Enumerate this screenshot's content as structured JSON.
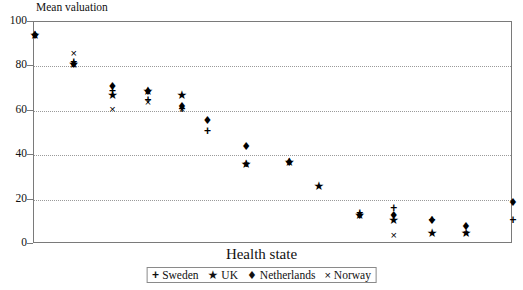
{
  "chart_data": {
    "type": "scatter",
    "title": "",
    "ylabel": "Mean valuation",
    "xlabel": "Health state",
    "ylim": [
      0,
      100
    ],
    "yticks": [
      0,
      20,
      40,
      60,
      80,
      100
    ],
    "grid": true,
    "legend_position": "bottom-center",
    "categories": [
      "1",
      "2",
      "3",
      "4",
      "5",
      "6",
      "7",
      "8",
      "9",
      "10",
      "11",
      "12",
      "13",
      "14"
    ],
    "series": [
      {
        "name": "Sweden",
        "symbol": "+",
        "values": [
          94,
          82,
          69,
          65,
          61,
          51,
          36,
          37,
          null,
          14,
          16,
          11,
          null,
          11
        ]
      },
      {
        "name": "UK",
        "symbol": "★",
        "values": [
          94,
          81,
          67,
          69,
          67,
          null,
          36,
          37,
          26,
          13,
          11,
          5,
          5,
          null
        ]
      },
      {
        "name": "Netherlands",
        "symbol": "♦",
        "values": [
          94,
          81,
          71,
          69,
          62,
          56,
          44,
          37,
          null,
          13,
          13,
          11,
          8,
          19
        ]
      },
      {
        "name": "Norway",
        "symbol": "×",
        "values": [
          94,
          86,
          61,
          64,
          61,
          null,
          36,
          null,
          null,
          null,
          4,
          null,
          5,
          null
        ]
      }
    ],
    "x_positions": [
      0.2,
      8.3,
      16.4,
      23.8,
      30.9,
      36.2,
      44.3,
      53.3,
      59.5,
      68.0,
      75.1,
      83.1,
      90.2,
      100.0
    ]
  },
  "legend": {
    "items": [
      {
        "symbol": "+",
        "label": "Sweden"
      },
      {
        "symbol": "★",
        "label": "UK"
      },
      {
        "symbol": "♦",
        "label": "Netherlands"
      },
      {
        "symbol": "×",
        "label": "Norway"
      }
    ]
  },
  "colors": {
    "marker": "#000000",
    "axis": "#7a7a7a",
    "grid": "#9a9a9a",
    "background": "#ffffff"
  }
}
